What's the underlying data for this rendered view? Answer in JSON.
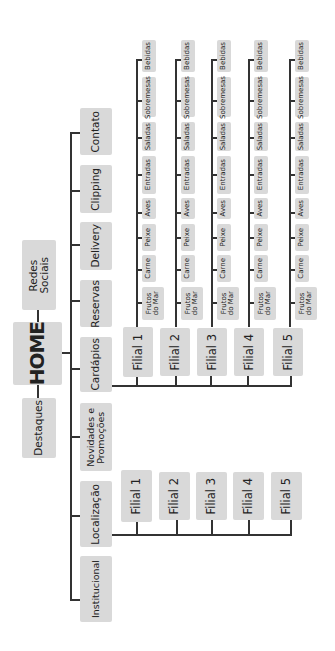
{
  "diagram": {
    "type": "sitemap",
    "orientation": "rotated-90-ccw",
    "root": {
      "label": "HOME"
    },
    "root_siblings": [
      {
        "label": "Redes Sociais",
        "line1": "Redes",
        "line2": "Sociais"
      },
      {
        "label": "Destaques"
      }
    ],
    "sections": [
      {
        "label": "Contato"
      },
      {
        "label": "Clipping"
      },
      {
        "label": "Delivery"
      },
      {
        "label": "Reservas"
      },
      {
        "label": "Cardápios"
      },
      {
        "label": "Novidades e Promoções",
        "line1": "Novidades e",
        "line2": "Promoções"
      },
      {
        "label": "Localização"
      },
      {
        "label": "Institucional"
      }
    ],
    "cardapios_branches": [
      {
        "label": "Filial 1"
      },
      {
        "label": "Filial 2"
      },
      {
        "label": "Filial 3"
      },
      {
        "label": "Filial 4"
      },
      {
        "label": "Filial 5"
      }
    ],
    "menu_items": [
      {
        "label": "Bebidas"
      },
      {
        "label": "Sobremesas"
      },
      {
        "label": "Saladas"
      },
      {
        "label": "Entradas"
      },
      {
        "label": "Aves"
      },
      {
        "label": "Peixe"
      },
      {
        "label": "Carne"
      },
      {
        "label": "Frutos do Mar",
        "line1": "Frutos",
        "line2": "do Mar"
      }
    ],
    "localizacao_branches": [
      {
        "label": "Filial 1"
      },
      {
        "label": "Filial 2"
      },
      {
        "label": "Filial 3"
      },
      {
        "label": "Filial 4"
      },
      {
        "label": "Filial 5"
      }
    ],
    "colors": {
      "box": "#d9d9d9",
      "line": "#333333",
      "background": "#ffffff"
    }
  }
}
